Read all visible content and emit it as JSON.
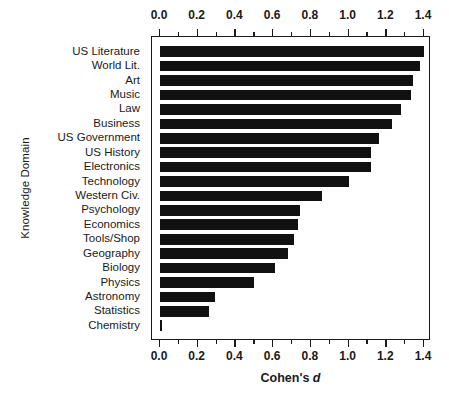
{
  "chart_data": {
    "type": "bar",
    "orientation": "horizontal",
    "title": "",
    "xlabel": "Cohen's d",
    "xlabel_prefix": "Cohen's ",
    "xlabel_italic": "d",
    "ylabel": "Knowledge Domain",
    "xlim": [
      0.0,
      1.4
    ],
    "xticks": [
      0.0,
      0.2,
      0.4,
      0.6,
      0.8,
      1.0,
      1.2,
      1.4
    ],
    "xtick_labels": [
      "0.0",
      "0.2",
      "0.4",
      "0.6",
      "0.8",
      "1.0",
      "1.2",
      "1.4"
    ],
    "minor_tick_step": 0.1,
    "grid": false,
    "legend": null,
    "top_axis": true,
    "bottom_axis": true,
    "bar_color": "#111111",
    "axis_color": "#1a1a1a",
    "background": "#ffffff",
    "categories": [
      "US Literature",
      "World Lit.",
      "Art",
      "Music",
      "Law",
      "Business",
      "US Government",
      "US History",
      "Electronics",
      "Technology",
      "Western Civ.",
      "Psychology",
      "Economics",
      "Tools/Shop",
      "Geography",
      "Biology",
      "Physics",
      "Astronomy",
      "Statistics",
      "Chemistry"
    ],
    "values": [
      1.4,
      1.38,
      1.34,
      1.33,
      1.28,
      1.23,
      1.16,
      1.12,
      1.12,
      1.0,
      0.86,
      0.74,
      0.73,
      0.71,
      0.68,
      0.61,
      0.5,
      0.29,
      0.26,
      0.01
    ]
  }
}
